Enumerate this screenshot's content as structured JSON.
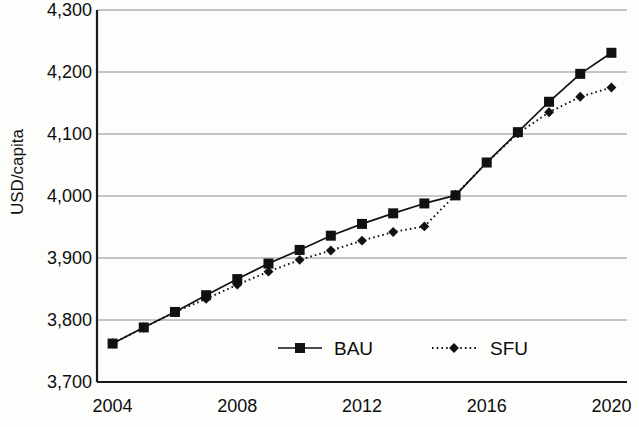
{
  "chart_data": {
    "type": "line",
    "title": "",
    "xlabel": "",
    "ylabel": "USD/capita",
    "x": [
      2004,
      2005,
      2006,
      2007,
      2008,
      2009,
      2010,
      2011,
      2012,
      2013,
      2014,
      2015,
      2016,
      2017,
      2018,
      2019,
      2020
    ],
    "xlim": [
      2003.5,
      2020.5
    ],
    "ylim": [
      3700,
      4300
    ],
    "xticks": [
      2004,
      2008,
      2012,
      2016,
      2020
    ],
    "xtick_labels": [
      "2004",
      "2008",
      "2012",
      "2016",
      "2020"
    ],
    "yticks": [
      3700,
      3800,
      3900,
      4000,
      4100,
      4200,
      4300
    ],
    "ytick_labels": [
      "3,700",
      "3,800",
      "3,900",
      "4,000",
      "4,100",
      "4,200",
      "4,300"
    ],
    "grid": "horizontal",
    "legend_position": "inside-bottom-center",
    "series": [
      {
        "name": "BAU",
        "marker": "square",
        "line_style": "solid",
        "color": "#111111",
        "values": [
          3762,
          3788,
          3813,
          3840,
          3866,
          3891,
          3913,
          3936,
          3955,
          3972,
          3988,
          4001,
          4054,
          4103,
          4152,
          4197,
          4231
        ]
      },
      {
        "name": "SFU",
        "marker": "diamond",
        "line_style": "dotted",
        "color": "#111111",
        "values": [
          3762,
          3788,
          3813,
          3834,
          3857,
          3878,
          3897,
          3912,
          3928,
          3942,
          3951,
          4002,
          4054,
          4101,
          4135,
          4160,
          4175
        ]
      }
    ]
  },
  "legend": {
    "entries": [
      {
        "label": "BAU"
      },
      {
        "label": "SFU"
      }
    ]
  },
  "axis": {
    "y_title": "USD/capita"
  }
}
